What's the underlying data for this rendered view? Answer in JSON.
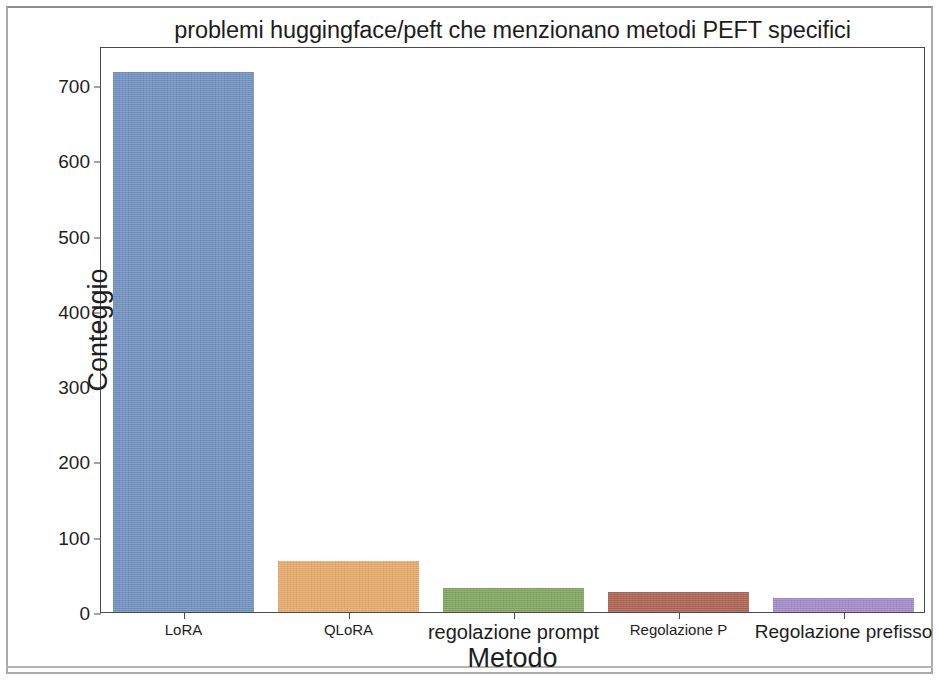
{
  "chart_data": {
    "type": "bar",
    "title": "problemi huggingface/peft che menzionano metodi PEFT specifici",
    "xlabel": "Metodo",
    "ylabel": "Conteggio",
    "categories": [
      "LoRA",
      "QLoRA",
      "regolazione prompt",
      "Regolazione P",
      "Regolazione prefisso"
    ],
    "values": [
      717,
      68,
      32,
      27,
      19
    ],
    "colors": [
      "#6f8fbe",
      "#e5a868",
      "#7ea55e",
      "#ad6151",
      "#a288c6"
    ],
    "ylim": [
      0,
      752
    ],
    "yticks": [
      0,
      100,
      200,
      300,
      400,
      500,
      600,
      700
    ],
    "ytick_labels": [
      "0",
      "100",
      "200",
      "300",
      "400",
      "500",
      "600",
      "700"
    ],
    "grid": false,
    "legend": null,
    "bar_label_font_sizes": [
      15,
      15,
      20,
      15,
      19
    ]
  },
  "figure": {
    "background_color": "#ffffff",
    "axes_edge_color": "#4a4a4a",
    "text_color": "#1d1d1d"
  }
}
